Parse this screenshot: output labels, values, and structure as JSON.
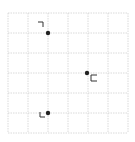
{
  "grid": {
    "x0": 8,
    "y0": 13,
    "cell": 20,
    "cols": 6,
    "rows": 6,
    "line_color": "#d0d0d0"
  },
  "points": [
    {
      "x": 48,
      "y": 33,
      "marker": "corner-top-left",
      "mx": 38,
      "my": 22
    },
    {
      "x": 87,
      "y": 73,
      "marker": "bracket-open-right",
      "mx": 91,
      "my": 78
    },
    {
      "x": 48,
      "y": 113,
      "marker": "corner-bottom-left",
      "mx": 40,
      "my": 117
    }
  ],
  "colors": {
    "point": "#222222",
    "marker": "#333333"
  }
}
